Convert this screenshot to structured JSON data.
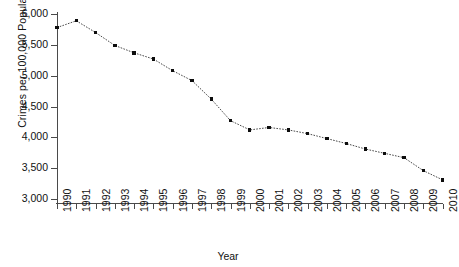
{
  "chart_data": {
    "type": "line",
    "title": "",
    "xlabel": "Year",
    "ylabel": "Crimes per 100,000 Population",
    "xlim": [
      1990,
      2010
    ],
    "ylim": [
      3000,
      6000
    ],
    "ytick_labels": [
      "6,000",
      "5,500",
      "5,000",
      "4,500",
      "4,000",
      "3,500",
      "3,000"
    ],
    "ytick_values": [
      6000,
      5500,
      5000,
      4500,
      4000,
      3500,
      3000
    ],
    "grid": false,
    "legend": false,
    "marker": "filled-square",
    "line_style": "dotted",
    "categories": [
      "1990",
      "1991",
      "1992",
      "1993",
      "1994",
      "1995",
      "1996",
      "1997",
      "1998",
      "1999",
      "2000",
      "2001",
      "2002",
      "2003",
      "2004",
      "2005",
      "2006",
      "2007",
      "2008",
      "2009",
      "2010"
    ],
    "values": [
      5780,
      5890,
      5700,
      5490,
      5370,
      5270,
      5080,
      4920,
      4620,
      4270,
      4120,
      4160,
      4120,
      4060,
      3980,
      3900,
      3810,
      3740,
      3670,
      3460,
      3310
    ]
  }
}
